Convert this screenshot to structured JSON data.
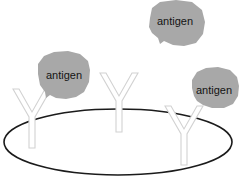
{
  "figure": {
    "type": "biology-schematic",
    "title": "",
    "background_color": "#ffffff",
    "width": 244,
    "height": 189
  },
  "colors": {
    "antigen_fill": "#a8a8a8",
    "antigen_text": "#141414",
    "antibody_fill": "#ffffff",
    "antibody_stroke": "#d2d2d2",
    "membrane_stroke": "#1b1b1b"
  },
  "membrane": {
    "name": "cell-surface-ellipse",
    "cx": 118,
    "cy": 142,
    "rx": 114,
    "ry": 33
  },
  "antigens": [
    {
      "id": "antigen-top",
      "label": "antigen",
      "label_x": 175,
      "label_y": 22,
      "fill": "#a8a8a8",
      "points": "150,18 152,8 160,2 176,0 192,2 202,10 205,22 203,34 196,43 184,46 173,45 164,41 160,44 158,38 152,33 149,27"
    },
    {
      "id": "antigen-left",
      "label": "antigen",
      "label_x": 64,
      "label_y": 76,
      "fill": "#a8a8a8",
      "points": "38,74 38,64 44,56 54,52 68,51 80,54 88,61 90,70 89,82 84,92 76,97 66,99 56,98 50,95 46,98 45,92 40,85"
    },
    {
      "id": "antigen-right",
      "label": "antigen",
      "label_x": 214,
      "label_y": 91,
      "fill": "#a8a8a8",
      "points": "192,88 192,80 197,72 206,68 218,67 230,70 237,77 239,86 238,96 233,104 224,108 212,108 203,105 197,101 194,96"
    }
  ],
  "antibodies": [
    {
      "id": "antibody-left",
      "label": "antibody",
      "bound": true,
      "points": "13,89 19,89 32,112 45,89 51,89 35,117 35,148 29,148 29,117"
    },
    {
      "id": "antibody-middle",
      "label": "antibody",
      "bound": false,
      "points": "100,73 106,73 119,96 132,73 138,73 122,101 122,132 116,132 116,101"
    },
    {
      "id": "antibody-right",
      "label": "antibody",
      "bound": true,
      "points": "165,106 171,106 184,129 197,106 203,106 187,134 187,165 181,165 181,134"
    }
  ],
  "bindings": [
    {
      "id": "binding-left",
      "from": "antibody-left",
      "to": "antigen-left",
      "x1": 45,
      "y1": 91,
      "x2": 50,
      "y2": 96
    },
    {
      "id": "binding-right",
      "from": "antibody-right",
      "to": "antigen-right",
      "x1": 197,
      "y1": 108,
      "x2": 200,
      "y2": 104
    }
  ]
}
